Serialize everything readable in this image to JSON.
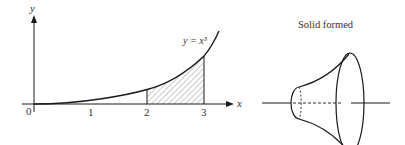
{
  "graph": {
    "y_axis_label": "y",
    "x_axis_label": "x",
    "origin_label": "0",
    "ticks": [
      "1",
      "2",
      "3"
    ],
    "curve_label": "y = x³",
    "curve_equation": "y = x^3",
    "shaded_region": {
      "from": 2,
      "to": 3
    }
  },
  "solid": {
    "title": "Solid formed"
  },
  "colors": {
    "stroke": "#1a1a1a",
    "text": "#333333",
    "hatch": "#555555"
  }
}
